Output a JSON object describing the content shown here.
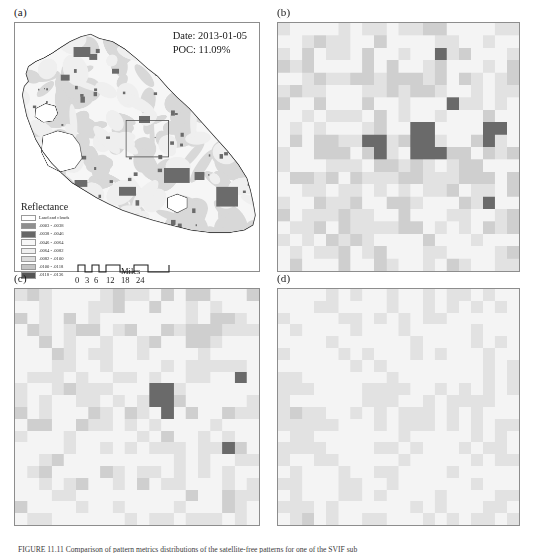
{
  "figure": {
    "caption": "FIGURE 11.11   Comparison of pattern metrics distributions of the satellite-free patterns for one of the SVIF sub"
  },
  "panels": {
    "a": {
      "label": "(a)",
      "annotation": {
        "date_line": "Date: 2013-01-05",
        "poc_line": "POC: 11.09%"
      },
      "legend": {
        "title": "Reflectance",
        "entries": [
          {
            "label": "Land and clouds",
            "color": "#ffffff"
          },
          {
            "label": ".0003 - .0038",
            "color": "#8f8f8f"
          },
          {
            "label": ".0038 - .0046",
            "color": "#676767"
          },
          {
            "label": ".0046 - .0064",
            "color": "#f7f7f7"
          },
          {
            "label": ".0064 - .0082",
            "color": "#efefef"
          },
          {
            "label": ".0082 - .0100",
            "color": "#dcdcdc"
          },
          {
            "label": ".0100 - .0118",
            "color": "#c4c4c4"
          },
          {
            "label": ".0118 - .0136",
            "color": "#555555"
          }
        ]
      },
      "scalebar": {
        "unit_label": "Miles",
        "ticks": [
          "0",
          "3",
          "6",
          "12",
          "18",
          "24"
        ]
      }
    },
    "b": {
      "label": "(b)"
    },
    "c": {
      "label": "(c)"
    },
    "d": {
      "label": "(d)"
    }
  },
  "colors": {
    "background": "#ffffff",
    "frame": "#8d8d8d",
    "raster_light": "#f4f4f4",
    "raster_mid": "#e2e2e2",
    "raster_gray": "#cfcfcf",
    "raster_dark": "#6a6a6a",
    "map_land": "#f6f6f6",
    "map_mid": "#d8d8d8",
    "map_dark": "#6b6b6b",
    "coastline": "#3a3a3a"
  },
  "chart_data": {
    "type": "heatmap",
    "grid_size": [
      20,
      20
    ],
    "legend_position": "inside-lower-left (panel a)",
    "value_classes": [
      ".0003 - .0038",
      ".0038 - .0046",
      ".0046 - .0064",
      ".0064 - .0082",
      ".0082 - .0100",
      ".0100 - .0118",
      ".0118 - .0136"
    ],
    "panels": [
      {
        "id": "a",
        "kind": "map",
        "date": "2013-01-05",
        "poc_percent": 11.09,
        "scale_unit": "Miles",
        "scale_ticks": [
          0,
          3,
          6,
          12,
          18,
          24
        ],
        "inset_box": {
          "x": 125,
          "y": 120,
          "w": 44,
          "h": 37
        }
      },
      {
        "id": "b",
        "kind": "raster",
        "cells_dark": 14,
        "cells_mid": 96,
        "cells_light": 290,
        "dark_cluster_center": [
          11,
          10
        ]
      },
      {
        "id": "c",
        "kind": "raster",
        "cells_dark": 7,
        "cells_mid": 88,
        "cells_light": 305,
        "dark_cluster_center": [
          11,
          9
        ]
      },
      {
        "id": "d",
        "kind": "raster",
        "cells_dark": 0,
        "cells_mid": 120,
        "cells_light": 280,
        "dark_cluster_center": null
      }
    ]
  }
}
